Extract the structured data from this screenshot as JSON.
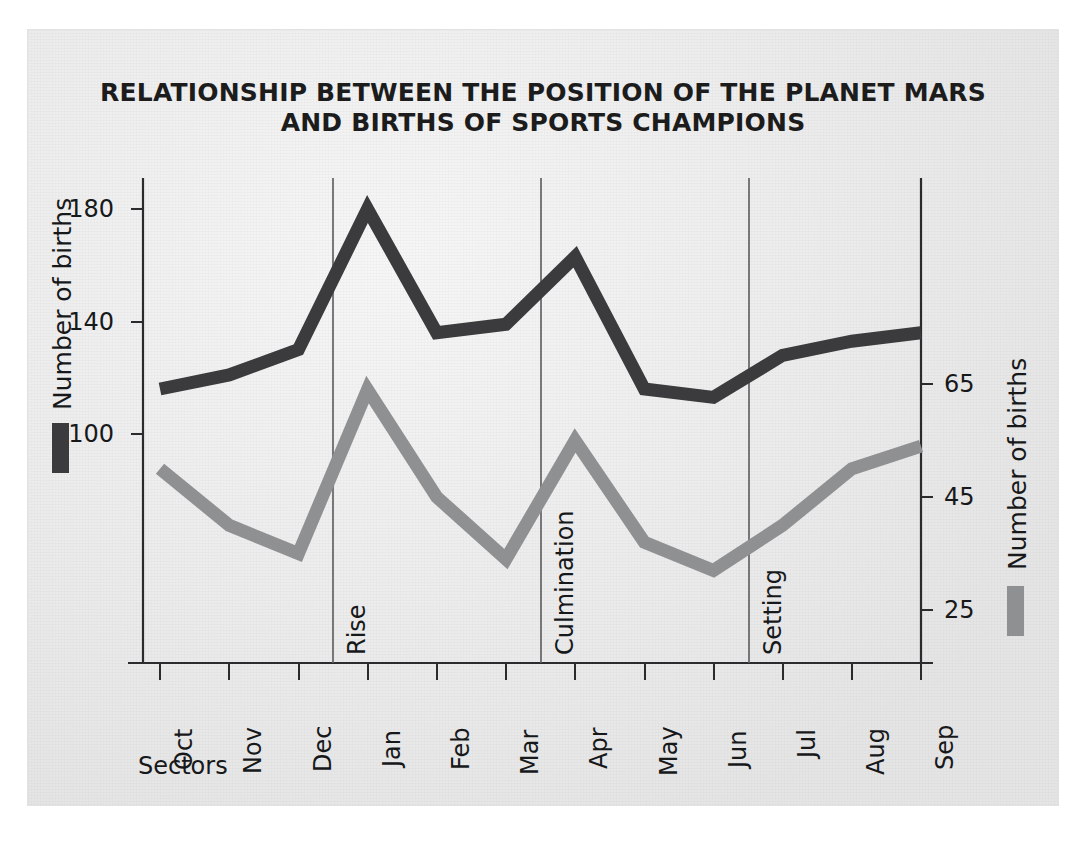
{
  "figure": {
    "background_color": "#ececed",
    "title_line1": "RELATIONSHIP BETWEEN THE POSITION OF THE PLANET MARS",
    "title_line2": "AND BIRTHS OF SPORTS CHAMPIONS",
    "x_caption": "Sectors",
    "left_axis_title": "Number of births",
    "right_axis_title": "Number of births",
    "dark_series_color": "#3b3b3d",
    "light_series_color": "#8f9092",
    "axis_color": "#2b2b2d"
  },
  "chart_data": {
    "type": "line",
    "title": "RELATIONSHIP BETWEEN THE POSITION OF THE PLANET MARS AND BIRTHS OF SPORTS CHAMPIONS",
    "xlabel": "Sectors",
    "ylabel": "Number of births",
    "y2label": "Number of births",
    "grid": false,
    "legend": "none",
    "categories": [
      "Oct",
      "Nov",
      "Dec",
      "Jan",
      "Feb",
      "Mar",
      "Apr",
      "May",
      "Jun",
      "Jul",
      "Aug",
      "Sep"
    ],
    "left_ticks": [
      100,
      140,
      180
    ],
    "right_ticks": [
      25,
      45,
      65
    ],
    "ylim": [
      20,
      200
    ],
    "y2lim": [
      16,
      80
    ],
    "annotations": [
      {
        "label": "Rise",
        "between": "Dec-Jan"
      },
      {
        "label": "Culmination",
        "between": "Mar-Apr"
      },
      {
        "label": "Setting",
        "between": "Jun-Jul"
      }
    ],
    "series": [
      {
        "name": "Number of births (left axis)",
        "axis": "left",
        "color": "#3b3b3d",
        "values": [
          116,
          121,
          130,
          180,
          136,
          139,
          163,
          116,
          113,
          128,
          133,
          136
        ]
      },
      {
        "name": "Number of births (right axis)",
        "axis": "right",
        "color": "#8f9092",
        "values": [
          50,
          40,
          35,
          64,
          45,
          34,
          55,
          37,
          32,
          40,
          50,
          54
        ]
      }
    ]
  }
}
